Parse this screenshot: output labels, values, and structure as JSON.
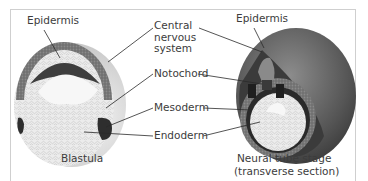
{
  "figure": {
    "left_panel": {
      "caption": "Blastula",
      "labels": {
        "epidermis": "Epidermis"
      }
    },
    "right_panel": {
      "caption_line1": "Neural tube stage",
      "caption_line2": "(transverse section)",
      "labels": {
        "epidermis": "Epidermis"
      }
    },
    "center_labels": {
      "cns_line1": "Central",
      "cns_line2": "nervous",
      "cns_line3": "system",
      "notochord": "Notochord",
      "mesoderm": "Mesoderm",
      "endoderm": "Endoderm"
    },
    "colors": {
      "epidermis_layer": "#6f6f6f",
      "neural_plate": "#3e3e3e",
      "mesoderm": "#2e2e2e",
      "endoderm": "#e6e6e6",
      "cavity": "#f7f7f7",
      "outer_shell": "#5a5a5a",
      "frame_border": "#cfcfcf"
    }
  }
}
